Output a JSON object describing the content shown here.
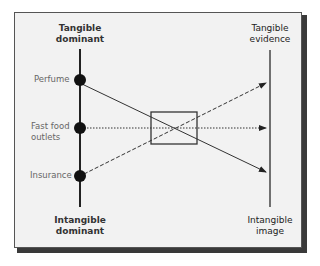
{
  "diagram": {
    "left_axis": {
      "top_label_line1": "Tangible",
      "top_label_line2": "dominant",
      "bottom_label_line1": "Intangible",
      "bottom_label_line2": "dominant"
    },
    "right_axis": {
      "top_label_line1": "Tangible",
      "top_label_line2": "evidence",
      "bottom_label_line1": "Intangible",
      "bottom_label_line2": "image"
    },
    "points": [
      {
        "label_line1": "Perfume",
        "label_line2": ""
      },
      {
        "label_line1": "Fast food",
        "label_line2": "outlets"
      },
      {
        "label_line1": "Insurance",
        "label_line2": ""
      }
    ],
    "connections": [
      {
        "from": "Perfume",
        "to": "Intangible image",
        "style": "solid"
      },
      {
        "from": "Fast food outlets",
        "to": "middle of right axis",
        "style": "dotted"
      },
      {
        "from": "Insurance",
        "to": "Tangible evidence",
        "style": "dashed"
      }
    ],
    "colors": {
      "background": "#f2f2f2",
      "line": "#333333",
      "label_text": "#666666"
    }
  }
}
